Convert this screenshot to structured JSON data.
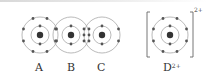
{
  "labels": {
    "a": "A",
    "b": "B",
    "c": "C",
    "d": "D",
    "d_charge": "2+"
  },
  "bracket_charge": "2+",
  "colors": {
    "orbit": "#9a9a9a",
    "electron": "#555555",
    "nucleus": "#333333",
    "text": "#333333"
  },
  "atoms": [
    {
      "id": "A",
      "cx": 40,
      "cy": 35,
      "shells": [
        9,
        18
      ],
      "electrons": [
        2,
        8
      ]
    },
    {
      "id": "B",
      "cx": 71,
      "cy": 35,
      "shells": [
        9,
        18
      ],
      "electrons": [
        2,
        8
      ],
      "shared_with": "C"
    },
    {
      "id": "C",
      "cx": 102,
      "cy": 35,
      "shells": [
        9,
        18
      ],
      "electrons": [
        2,
        8
      ],
      "shared_with": "B"
    },
    {
      "id": "D",
      "cx": 170,
      "cy": 35,
      "shells": [
        9,
        18
      ],
      "electrons": [
        2,
        8
      ],
      "ion_charge": "2+"
    }
  ]
}
